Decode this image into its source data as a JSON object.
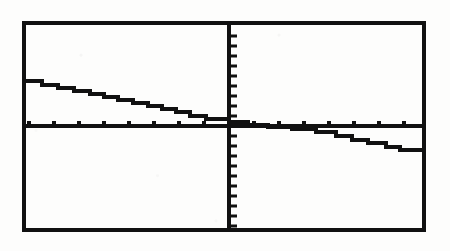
{
  "device": {
    "kind": "graphing-calculator-screen",
    "screen_label": "",
    "ink_color": "#111111",
    "background_color": "#fdfdfc"
  },
  "frame": {
    "left": 22,
    "top": 21,
    "right": 426,
    "bottom": 232,
    "border_width": 4
  },
  "axes": {
    "x_axis_y": 126,
    "y_axis_x": 229,
    "axis_width": 4,
    "x_tick_count_left": 8,
    "x_tick_count_right": 8,
    "y_tick_count_up": 10,
    "y_tick_count_down": 10,
    "x_tick_spacing": 25,
    "y_tick_spacing": 10,
    "x_tick_length": 4,
    "y_tick_length": 7
  },
  "chart_data": {
    "type": "line",
    "title": "",
    "subtitle": "",
    "xlabel": "",
    "ylabel": "",
    "grid": false,
    "legend": "none",
    "style": "step",
    "xlim": [
      -8,
      8
    ],
    "ylim": [
      -10,
      10
    ],
    "xticks": [
      -8,
      -7,
      -6,
      -5,
      -4,
      -3,
      -2,
      -1,
      0,
      1,
      2,
      3,
      4,
      5,
      6,
      7,
      8
    ],
    "yticks": [
      -10,
      -9,
      -8,
      -7,
      -6,
      -5,
      -4,
      -3,
      -2,
      -1,
      0,
      1,
      2,
      3,
      4,
      5,
      6,
      7,
      8,
      9,
      10
    ],
    "series": [
      {
        "name": "step-function",
        "x": [
          -8.0,
          -7.5,
          -7.0,
          -6.5,
          -6.0,
          -5.5,
          -5.0,
          -4.5,
          -4.0,
          -3.5,
          -3.0,
          -2.5,
          -2.0,
          -1.5,
          -1.0,
          -0.5,
          0.0,
          0.5,
          1.0,
          1.5,
          2.0,
          2.5,
          3.0,
          3.5,
          4.0,
          4.5,
          5.0,
          5.5,
          6.0,
          6.5,
          7.0,
          7.5,
          8.0
        ],
        "y": [
          2.4,
          2.4,
          2.2,
          2.2,
          2.05,
          1.95,
          1.8,
          1.7,
          1.55,
          1.4,
          1.25,
          1.15,
          1.0,
          0.85,
          0.7,
          0.55,
          0.4,
          0.3,
          0.2,
          0.15,
          0.05,
          0.0,
          -0.05,
          -0.15,
          -0.3,
          -0.45,
          -0.6,
          -0.75,
          -0.9,
          -1.05,
          -1.2,
          -1.35,
          -1.4
        ]
      }
    ]
  },
  "pixel_path": {
    "note": "Polyline vertices in screenshot pixel coordinates tracing the drawn staircase.",
    "points": [
      [
        24,
        81
      ],
      [
        42,
        81
      ],
      [
        42,
        85
      ],
      [
        58,
        85
      ],
      [
        58,
        88
      ],
      [
        74,
        88
      ],
      [
        74,
        91
      ],
      [
        90,
        91
      ],
      [
        90,
        94
      ],
      [
        104,
        94
      ],
      [
        104,
        97
      ],
      [
        118,
        97
      ],
      [
        118,
        100
      ],
      [
        133,
        100
      ],
      [
        133,
        103
      ],
      [
        148,
        103
      ],
      [
        148,
        106
      ],
      [
        162,
        106
      ],
      [
        162,
        109
      ],
      [
        176,
        109
      ],
      [
        176,
        112
      ],
      [
        190,
        112
      ],
      [
        190,
        116
      ],
      [
        206,
        116
      ],
      [
        206,
        119
      ],
      [
        229,
        119
      ],
      [
        229,
        122
      ],
      [
        248,
        122
      ],
      [
        248,
        125
      ],
      [
        268,
        125
      ],
      [
        268,
        127
      ],
      [
        292,
        127
      ],
      [
        292,
        129
      ],
      [
        316,
        129
      ],
      [
        316,
        132
      ],
      [
        336,
        132
      ],
      [
        336,
        136
      ],
      [
        352,
        136
      ],
      [
        352,
        140
      ],
      [
        368,
        140
      ],
      [
        368,
        143
      ],
      [
        386,
        143
      ],
      [
        386,
        147
      ],
      [
        400,
        147
      ],
      [
        400,
        150
      ],
      [
        424,
        150
      ]
    ]
  }
}
